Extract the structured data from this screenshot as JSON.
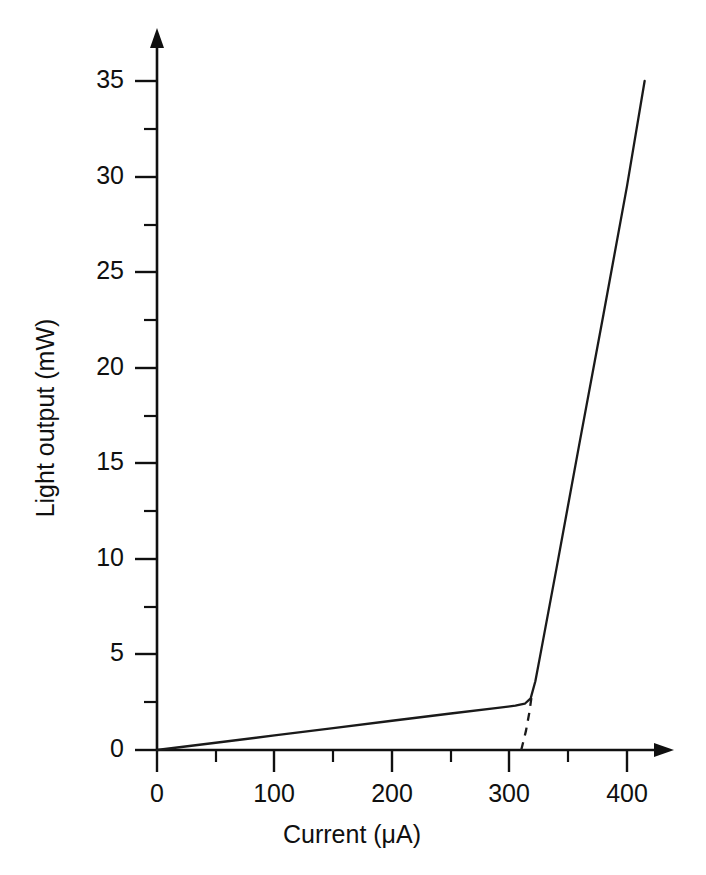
{
  "chart_data": {
    "type": "line",
    "title": "",
    "subtitle": "",
    "xlabel": "Current (μA)",
    "ylabel": "Light output (mW)",
    "xlim": [
      0,
      440
    ],
    "ylim": [
      0,
      37
    ],
    "xticks": [
      0,
      100,
      200,
      300,
      400
    ],
    "yticks": [
      0,
      5,
      10,
      15,
      20,
      25,
      30,
      35
    ],
    "xticklabels": [
      "0",
      "100",
      "200",
      "300",
      "400"
    ],
    "yticklabels": [
      "0",
      "5",
      "10",
      "15",
      "20",
      "25",
      "30",
      "35"
    ],
    "x_minor_ticks": [
      50,
      150,
      250,
      350
    ],
    "y_minor_ticks": [
      2.5,
      7.5,
      12.5,
      17.5,
      22.5,
      27.5,
      32.5
    ],
    "grid": false,
    "legend": null,
    "axis_style": "arrow",
    "annotations": [],
    "series": [
      {
        "name": "Light output",
        "style": "solid",
        "points": [
          {
            "x": 0,
            "y": 0.0
          },
          {
            "x": 50,
            "y": 0.38
          },
          {
            "x": 100,
            "y": 0.76
          },
          {
            "x": 150,
            "y": 1.15
          },
          {
            "x": 200,
            "y": 1.53
          },
          {
            "x": 250,
            "y": 1.91
          },
          {
            "x": 290,
            "y": 2.2
          },
          {
            "x": 305,
            "y": 2.32
          },
          {
            "x": 313,
            "y": 2.42
          },
          {
            "x": 318,
            "y": 2.7
          },
          {
            "x": 322,
            "y": 3.6
          },
          {
            "x": 326,
            "y": 4.9
          },
          {
            "x": 340,
            "y": 9.5
          },
          {
            "x": 360,
            "y": 16.2
          },
          {
            "x": 380,
            "y": 22.8
          },
          {
            "x": 400,
            "y": 29.5
          },
          {
            "x": 415,
            "y": 35.0
          }
        ]
      },
      {
        "name": "Threshold extrapolation",
        "style": "dashed",
        "points": [
          {
            "x": 310,
            "y": 0.0
          },
          {
            "x": 314,
            "y": 1.0
          },
          {
            "x": 317,
            "y": 2.0
          },
          {
            "x": 319,
            "y": 2.9
          }
        ]
      }
    ],
    "threshold_current": 310,
    "threshold_knee": {
      "x": 315,
      "y": 2.4
    },
    "max_point": {
      "x": 415,
      "y": 35.0
    }
  },
  "figure": {
    "background_color": "#ffffff",
    "line_color": "#1a1a1a",
    "text_color": "#101010"
  }
}
